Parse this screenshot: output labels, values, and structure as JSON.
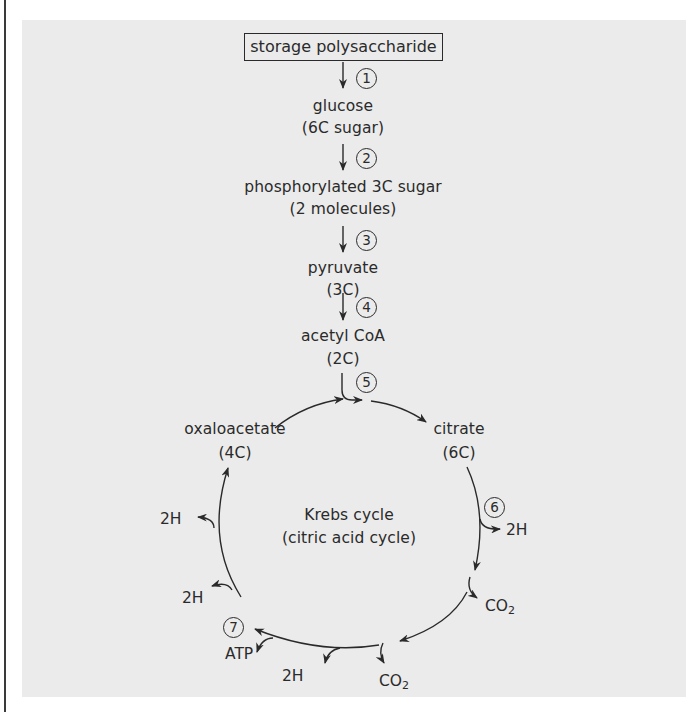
{
  "diagram": {
    "title": "Krebs cycle",
    "subtitle": "(citric acid cycle)",
    "colors": {
      "background": "#ffffff",
      "panel": "#ebebeb",
      "ink": "#2a2a2a"
    },
    "pathway": {
      "start": "storage polysaccharide",
      "nodes": [
        {
          "name": "glucose",
          "detail": "(6C sugar)"
        },
        {
          "name": "phosphorylated 3C sugar",
          "detail": "(2 molecules)"
        },
        {
          "name": "pyruvate",
          "detail": "(3C)"
        },
        {
          "name": "acetyl CoA",
          "detail": "(2C)"
        }
      ],
      "steps": [
        "1",
        "2",
        "3",
        "4",
        "5",
        "6",
        "7"
      ]
    },
    "cycle": {
      "oxaloacetate": {
        "name": "oxaloacetate",
        "detail": "(4C)"
      },
      "citrate": {
        "name": "citrate",
        "detail": "(6C)"
      },
      "outputs": {
        "h_right": "2H",
        "co2_right": "CO",
        "co2_right_sub": "2",
        "co2_bottom": "CO",
        "co2_bottom_sub": "2",
        "h_bottom": "2H",
        "atp": "ATP",
        "h_left_lower": "2H",
        "h_left_upper": "2H"
      }
    }
  }
}
